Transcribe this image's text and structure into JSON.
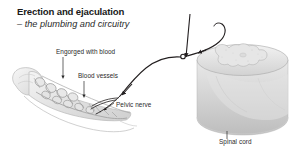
{
  "figure": {
    "title": "Erection and ejaculation",
    "subtitle": "– the plumbing and circuitry",
    "background_color": "#ffffff",
    "line_color": "#231f20",
    "tissue_color": "#d9d9d9",
    "labels": {
      "engorged": "Engorged with blood",
      "blood_vessels": "Blood vessels",
      "pelvic_nerve": "Pelvic nerve",
      "spinal_cord": "Spinal cord"
    },
    "icons": {
      "leader_engorged": "leader-line-icon",
      "leader_vessels": "leader-line-icon",
      "leader_spinal": "leader-line-icon",
      "arrow_pelvic": "arrowhead-icon",
      "arrow_descending": "arrowhead-icon",
      "arrow_afferent": "arrowhead-icon",
      "synapse_node": "nerve-junction-icon"
    },
    "structures": {
      "penis_cross_section": "penis-erectile-tissue-illustration",
      "spinal_cord_block": "spinal-cord-segment-illustration",
      "nerve_pathway": "pelvic-nerve-pathway"
    }
  }
}
